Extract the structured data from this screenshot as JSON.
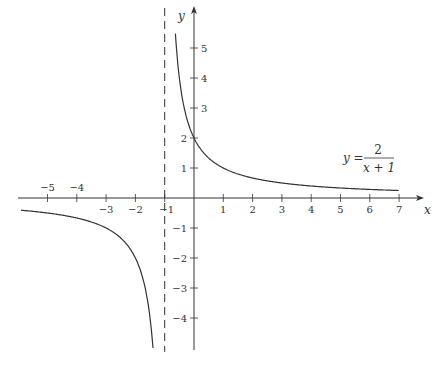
{
  "chart_data": {
    "type": "line",
    "title": "",
    "function": "y = 2/(x+1)",
    "annotation": {
      "lhs": "y =",
      "numerator": "2",
      "denominator": "x + 1"
    },
    "xlabel": "x",
    "ylabel": "y",
    "xlim": [
      -6,
      8
    ],
    "ylim": [
      -5,
      5.7
    ],
    "x_ticks": [
      -5,
      -4,
      -3,
      -2,
      -1,
      1,
      2,
      3,
      4,
      5,
      6,
      7
    ],
    "y_ticks": [
      -4,
      -3,
      -2,
      -1,
      1,
      2,
      3,
      4,
      5
    ],
    "x_tick_labels": [
      "−5",
      "−4",
      "−3",
      "−2",
      "−1",
      "1",
      "2",
      "3",
      "4",
      "5",
      "6",
      "7"
    ],
    "y_tick_labels": [
      "−4",
      "−3",
      "−2",
      "−1",
      "1",
      "2",
      "3",
      "4",
      "5"
    ],
    "asymptotes": {
      "vertical": -1,
      "horizontal": 0,
      "style": "dashed vertical line at x = -1"
    },
    "grid": false,
    "series": [
      {
        "name": "right branch",
        "x": [
          -0.64,
          -0.5,
          0,
          1,
          2,
          3,
          4,
          5,
          6,
          7
        ],
        "y": [
          5.5,
          4,
          2,
          1,
          0.667,
          0.5,
          0.4,
          0.333,
          0.286,
          0.25
        ]
      },
      {
        "name": "left branch",
        "x": [
          -5.9,
          -5,
          -4,
          -3,
          -2,
          -1.5,
          -1.4
        ],
        "y": [
          -0.41,
          -0.5,
          -0.667,
          -1,
          -2,
          -4,
          -5
        ]
      }
    ]
  }
}
